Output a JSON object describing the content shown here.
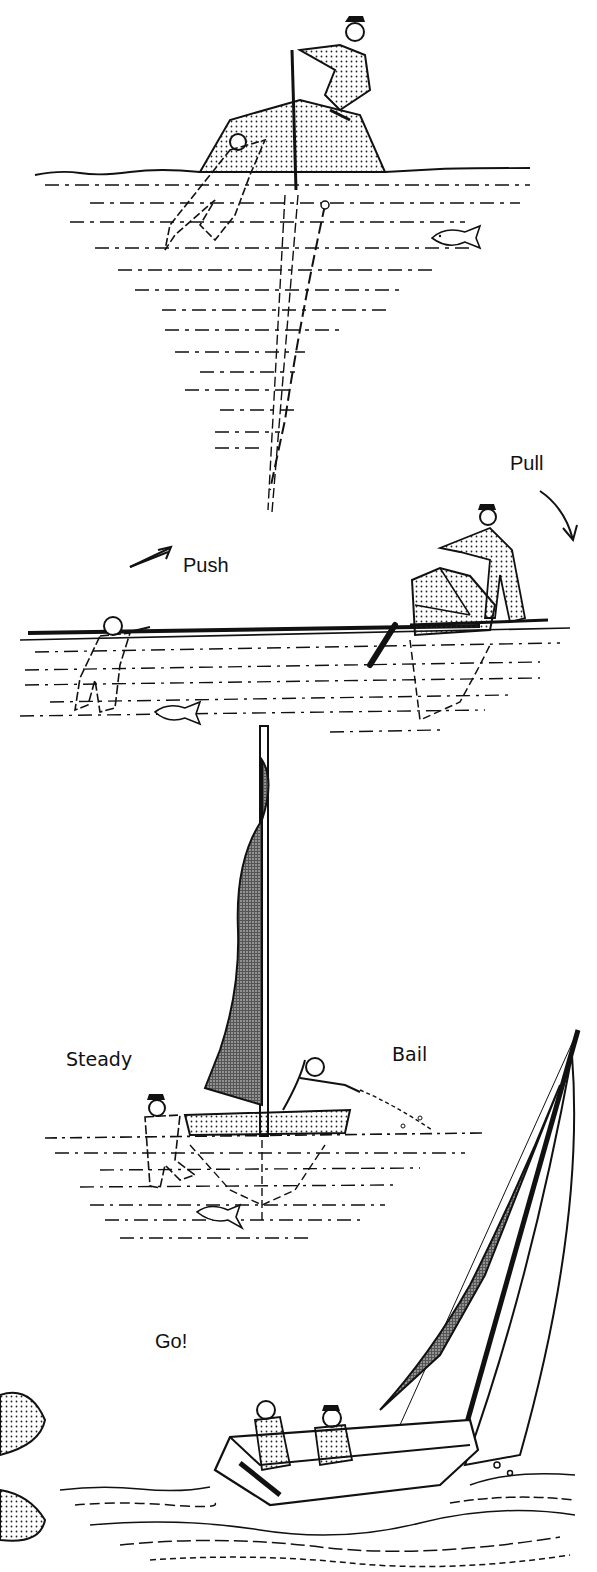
{
  "illustration": {
    "colors": {
      "ink": "#111111",
      "paper": "#ffffff",
      "stipple": "#555555"
    },
    "panels": [
      {
        "id": "righting-on-centerboard",
        "labels": []
      },
      {
        "id": "push-pull",
        "labels": [
          {
            "text": "Push"
          },
          {
            "text": "Pull"
          }
        ]
      },
      {
        "id": "steady-bail",
        "labels": [
          {
            "text": "Steady"
          },
          {
            "text": "Bail"
          }
        ]
      },
      {
        "id": "sailing-away",
        "labels": [
          {
            "text": "Go!"
          }
        ]
      }
    ]
  }
}
